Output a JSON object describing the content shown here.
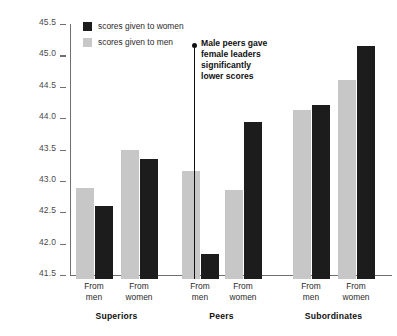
{
  "chart_data": {
    "type": "bar",
    "title": "",
    "xlabel": "",
    "ylabel": "",
    "ylim": [
      41.5,
      45.5
    ],
    "ytick_step": 0.5,
    "grid": false,
    "legend_position": "top-left",
    "yticks": [
      "45.5",
      "45.0",
      "44.5",
      "44.0",
      "43.5",
      "43.0",
      "42.5",
      "42.0",
      "41.5"
    ],
    "ytick_values": [
      45.5,
      45.0,
      44.5,
      44.0,
      43.5,
      43.0,
      42.5,
      42.0,
      41.5
    ],
    "groups": [
      "Superiors",
      "Peers",
      "Subordinates"
    ],
    "categories": [
      "Superiors / From men",
      "Superiors / From women",
      "Peers / From men",
      "Peers / From women",
      "Subordinates / From men",
      "Subordinates / From women"
    ],
    "subcategories": [
      "From men",
      "From women"
    ],
    "series": [
      {
        "name": "scores given to men",
        "color": "#c7c7c7",
        "values": [
          42.95,
          43.55,
          43.22,
          42.92,
          44.2,
          44.67
        ]
      },
      {
        "name": "scores given to women",
        "color": "#1c1c1c",
        "values": [
          42.67,
          43.42,
          41.9,
          44.0,
          44.27,
          45.22
        ]
      }
    ],
    "annotations": [
      {
        "text": "Male peers gave\nfemale leaders\nsignificantly\nlower scores",
        "anchor": "Peers / From men"
      }
    ]
  },
  "legend": {
    "items": [
      {
        "label": "scores given to women",
        "color": "#1c1c1c",
        "key": "women"
      },
      {
        "label": "scores given to men",
        "color": "#c7c7c7",
        "key": "men"
      }
    ]
  },
  "axis": {
    "ticks": [
      {
        "label": "45.5"
      },
      {
        "label": "45.0"
      },
      {
        "label": "44.5"
      },
      {
        "label": "44.0"
      },
      {
        "label": "43.5"
      },
      {
        "label": "43.0"
      },
      {
        "label": "42.5"
      },
      {
        "label": "42.0"
      },
      {
        "label": "41.5"
      }
    ]
  },
  "groups": [
    {
      "name": "Superiors",
      "pairs": [
        {
          "label": "From\nmen",
          "men": 42.95,
          "women": 42.67
        },
        {
          "label": "From\nwomen",
          "men": 43.55,
          "women": 43.42
        }
      ]
    },
    {
      "name": "Peers",
      "pairs": [
        {
          "label": "From\nmen",
          "men": 43.22,
          "women": 41.9
        },
        {
          "label": "From\nwomen",
          "men": 42.92,
          "women": 44.0
        }
      ]
    },
    {
      "name": "Subordinates",
      "pairs": [
        {
          "label": "From\nmen",
          "men": 44.2,
          "women": 44.27
        },
        {
          "label": "From\nwomen",
          "men": 44.67,
          "women": 45.22
        }
      ]
    }
  ],
  "annotation": {
    "text": "Male peers gave\nfemale leaders\nsignificantly\nlower scores"
  },
  "colors": {
    "women_bar": "#1c1c1c",
    "men_bar": "#c7c7c7",
    "axis": "#6f6f6f",
    "annotation": "#111111",
    "background": "#ffffff"
  }
}
